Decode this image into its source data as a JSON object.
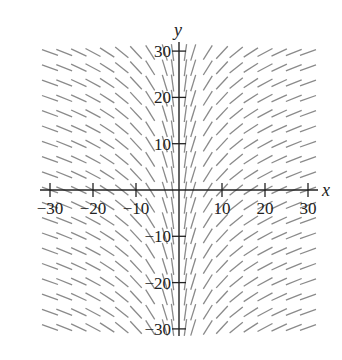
{
  "chart_data": {
    "type": "slope_field",
    "title": "",
    "equation_hint": "dy/dx = 10/x (slopes depend only on x)",
    "xlabel": "x",
    "ylabel": "y",
    "xlim": [
      -31,
      31
    ],
    "ylim": [
      -31,
      31
    ],
    "x_ticks": [
      -30,
      -20,
      -10,
      10,
      20,
      30
    ],
    "y_ticks": [
      -30,
      -20,
      -10,
      10,
      20,
      30
    ],
    "x_tick_labels": [
      "−30",
      "−20",
      "−10",
      "10",
      "20",
      "30"
    ],
    "y_tick_labels": [
      "−30",
      "−20",
      "−10",
      "10",
      "20",
      "30"
    ],
    "grid": false,
    "legend": null,
    "field_grid": {
      "x_samples": [
        -30,
        -26.7,
        -23.3,
        -20,
        -16.7,
        -13.3,
        -10,
        -6.7,
        -3.3,
        -1.5,
        1.5,
        3.3,
        6.7,
        10,
        13.3,
        16.7,
        20,
        23.3,
        26.7,
        30
      ],
      "y_step": 3.3,
      "y_range": [
        -33,
        33
      ]
    },
    "colors": {
      "segment": "#8a8a8a",
      "axis": "#222222"
    }
  }
}
